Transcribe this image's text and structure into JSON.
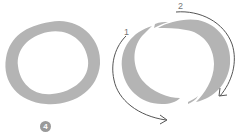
{
  "figure": {
    "step_badge": "4",
    "left_ring": {
      "shape": "oval-ring",
      "fill": "#b4b4b4"
    },
    "right_ring": {
      "shape": "split-oval-ring",
      "fill": "#b4b4b4",
      "arrows": [
        {
          "label": "1",
          "direction": "counterclockwise-down-left-to-bottom"
        },
        {
          "label": "2",
          "direction": "clockwise-top-to-right"
        }
      ]
    },
    "colors": {
      "ring": "#b4b4b4",
      "arrow": "#555555",
      "label": "#777777",
      "badge": "#9a9a9a"
    }
  }
}
